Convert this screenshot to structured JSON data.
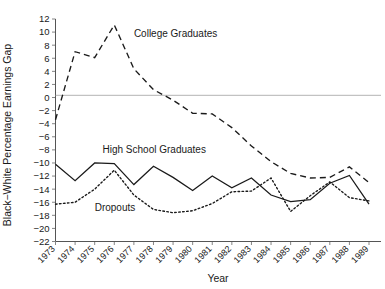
{
  "chart_data": {
    "type": "line",
    "title": "",
    "xlabel": "Year",
    "ylabel": "Black−White Percentage Earnings Gap",
    "x": [
      1973,
      1974,
      1975,
      1976,
      1977,
      1978,
      1979,
      1980,
      1981,
      1982,
      1983,
      1984,
      1985,
      1986,
      1987,
      1988,
      1989
    ],
    "categories": [
      "1973",
      "1974",
      "1975",
      "1976",
      "1977",
      "1978",
      "1979",
      "1980",
      "1981",
      "1982",
      "1983",
      "1984",
      "1985",
      "1986",
      "1987",
      "1988",
      "1989"
    ],
    "xlim": [
      1973,
      1989
    ],
    "ylim": [
      -22,
      12
    ],
    "yticks": [
      12,
      10,
      8,
      6,
      4,
      2,
      0,
      -2,
      -4,
      -6,
      -8,
      -10,
      -12,
      -14,
      -16,
      -18,
      -20,
      -22
    ],
    "ytick_labels": [
      "12",
      "10",
      "8",
      "6",
      "4",
      "2",
      "0",
      "−2",
      "−4",
      "−6",
      "−8",
      "−10",
      "−12",
      "−14",
      "−16",
      "−18",
      "−20",
      "−22"
    ],
    "grid": false,
    "legend_position": "inline-annotations",
    "zero_reference_line": 0,
    "series": [
      {
        "name": "College Graduates",
        "dash": "dashed",
        "label_x": 1977.0,
        "label_y": 9.2,
        "values": [
          -3.4,
          7.0,
          6.1,
          11.1,
          4.4,
          1.2,
          -0.4,
          -2.4,
          -2.5,
          -4.6,
          -7.4,
          -9.8,
          -11.6,
          -12.3,
          -12.2,
          -10.6,
          -13.0
        ]
      },
      {
        "name": "High School Graduates",
        "dash": "solid",
        "label_x": 1975.4,
        "label_y": -8.4,
        "values": [
          -10.2,
          -12.7,
          -10.0,
          -10.1,
          -13.3,
          -10.5,
          -12.2,
          -14.2,
          -12.0,
          -13.8,
          -12.3,
          -14.9,
          -15.9,
          -15.6,
          -13.1,
          -11.9,
          -16.3
        ]
      },
      {
        "name": "Dropouts",
        "dash": "dotted",
        "label_x": 1975.0,
        "label_y": -17.4,
        "values": [
          -16.3,
          -16.0,
          -14.0,
          -11.1,
          -14.9,
          -17.1,
          -17.6,
          -17.3,
          -16.2,
          -14.4,
          -14.3,
          -12.3,
          -17.4,
          -15.0,
          -12.9,
          -15.3,
          -15.8
        ]
      }
    ]
  },
  "axes": {
    "x_title": "Year",
    "y_title": "Black−White Percentage Earnings Gap"
  },
  "annotations": [
    {
      "name": "college-graduates",
      "text": "College Graduates"
    },
    {
      "name": "high-school-graduates",
      "text": "High School Graduates"
    },
    {
      "name": "dropouts",
      "text": "Dropouts"
    }
  ],
  "colors": {
    "line": "#1a1a1a",
    "axis": "#555555",
    "zero_line": "#aaaaaa",
    "background": "#ffffff"
  }
}
